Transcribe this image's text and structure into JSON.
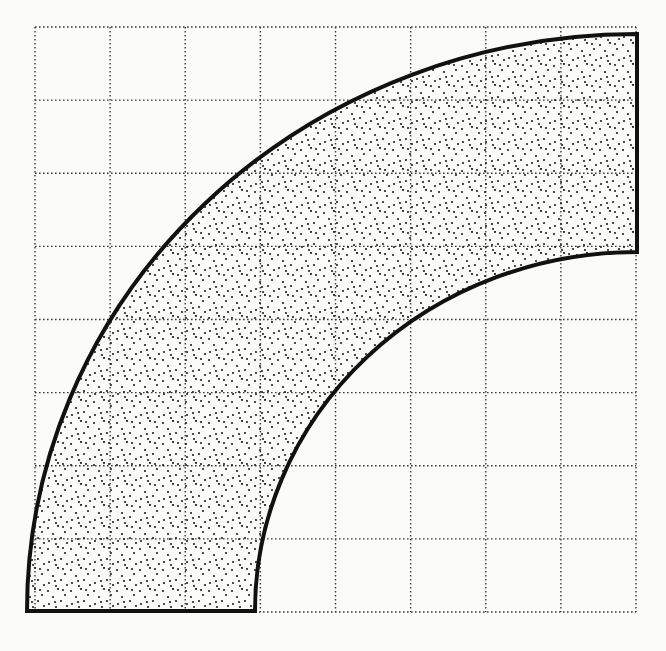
{
  "figure": {
    "grid": {
      "columns": 8,
      "rows": 8,
      "left": 35,
      "top": 27,
      "right": 636,
      "bottom": 612,
      "line_style": "dotted",
      "line_color": "#3a3a3a"
    },
    "shape": {
      "type": "quarter-annulus",
      "center": [
        637,
        611
      ],
      "outer_radius": [
        610,
        577
      ],
      "inner_radius": [
        382,
        359
      ],
      "fill_pattern": "stipple",
      "stroke_color": "#111111",
      "stroke_width": 4,
      "dot_color": "#222222",
      "bottom_edge": {
        "from": [
          27,
          611
        ],
        "to": [
          255,
          611
        ]
      },
      "right_edge": {
        "from": [
          637,
          34
        ],
        "to": [
          637,
          252
        ]
      }
    },
    "background_color": "#fbfbf9"
  }
}
